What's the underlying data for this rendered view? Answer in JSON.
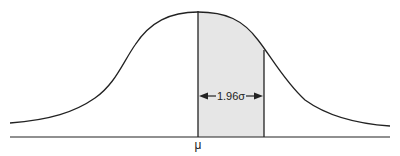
{
  "diagram": {
    "type": "normal-distribution",
    "mean_label": "μ",
    "interval_label": "1.96σ",
    "shaded_region": "mean to mean + 1.96σ",
    "colors": {
      "curve": "#222222",
      "shade": "#e6e6e6",
      "background": "#ffffff"
    }
  }
}
